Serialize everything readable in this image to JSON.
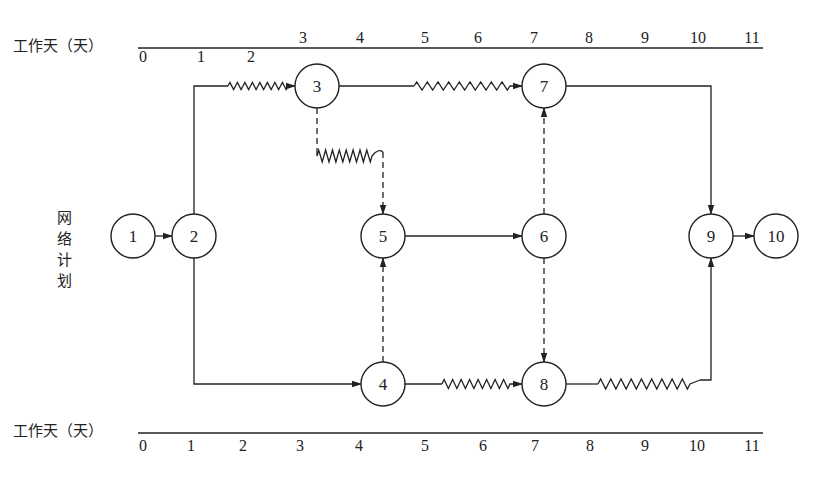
{
  "header_fragment": "",
  "top_axis": {
    "title": "工作天（天）",
    "ticks": [
      "0",
      "1",
      "2",
      "3",
      "4",
      "5",
      "6",
      "7",
      "8",
      "9",
      "10",
      "11"
    ]
  },
  "bottom_axis": {
    "title": "工作天（天）",
    "ticks": [
      "0",
      "1",
      "2",
      "3",
      "4",
      "5",
      "6",
      "7",
      "8",
      "9",
      "10",
      "11"
    ]
  },
  "side_label": [
    "网",
    "络",
    "计",
    "划"
  ],
  "nodes": [
    {
      "id": "1",
      "label": "1"
    },
    {
      "id": "2",
      "label": "2"
    },
    {
      "id": "3",
      "label": "3"
    },
    {
      "id": "4",
      "label": "4"
    },
    {
      "id": "5",
      "label": "5"
    },
    {
      "id": "6",
      "label": "6"
    },
    {
      "id": "7",
      "label": "7"
    },
    {
      "id": "8",
      "label": "8"
    },
    {
      "id": "9",
      "label": "9"
    },
    {
      "id": "10",
      "label": "10"
    }
  ],
  "edges": [
    {
      "from": "1",
      "to": "2",
      "type": "activity"
    },
    {
      "from": "2",
      "to": "3",
      "type": "activity-with-free-float"
    },
    {
      "from": "2",
      "to": "4",
      "type": "activity"
    },
    {
      "from": "3",
      "to": "7",
      "type": "activity-with-free-float"
    },
    {
      "from": "3",
      "to": "5",
      "type": "dummy-with-free-float"
    },
    {
      "from": "4",
      "to": "5",
      "type": "dummy"
    },
    {
      "from": "4",
      "to": "8",
      "type": "activity-with-free-float"
    },
    {
      "from": "5",
      "to": "6",
      "type": "activity"
    },
    {
      "from": "6",
      "to": "7",
      "type": "dummy"
    },
    {
      "from": "6",
      "to": "8",
      "type": "dummy"
    },
    {
      "from": "7",
      "to": "9",
      "type": "activity"
    },
    {
      "from": "8",
      "to": "9",
      "type": "activity-with-free-float"
    },
    {
      "from": "9",
      "to": "10",
      "type": "activity"
    }
  ],
  "legend_semantics": {
    "solid_line": "work activity",
    "dashed_line": "dummy activity",
    "wavy_line": "free float"
  }
}
